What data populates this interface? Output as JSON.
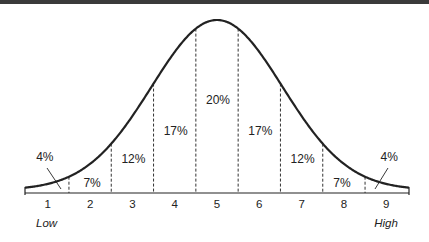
{
  "chart_data": {
    "type": "area",
    "title": "",
    "subtitle": "",
    "xlabel": "",
    "ylabel": "",
    "categories": [
      "1",
      "2",
      "3",
      "4",
      "5",
      "6",
      "7",
      "8",
      "9"
    ],
    "values": [
      4,
      7,
      12,
      17,
      20,
      17,
      12,
      7,
      4
    ],
    "value_labels": [
      "4%",
      "7%",
      "12%",
      "17%",
      "20%",
      "17%",
      "12%",
      "7%",
      "4%"
    ],
    "end_labels": {
      "low": "Low",
      "high": "High"
    },
    "curve": "normal distribution (bell curve)",
    "grid": false,
    "legend": "none",
    "dividers": "dashed vertical lines between categories"
  }
}
